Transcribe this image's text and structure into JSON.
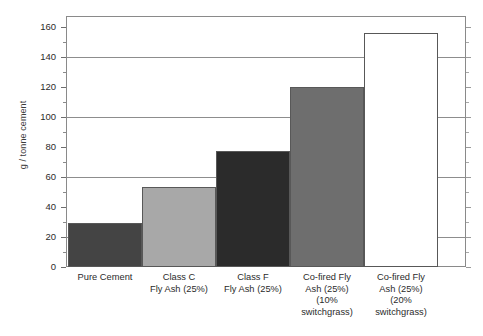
{
  "chart_data": {
    "type": "bar",
    "title": "",
    "subtitle": "",
    "xlabel": "",
    "ylabel": "g / tonne cement",
    "ylim": [
      0,
      167
    ],
    "grid": true,
    "legend": "none",
    "gridline_values": [
      20,
      60,
      100,
      140
    ],
    "y_major_ticks": [
      0,
      20,
      40,
      60,
      80,
      100,
      120,
      140,
      160
    ],
    "y_minor_tick_step": 10,
    "y_tick_labels": [
      "0",
      "20",
      "40",
      "60",
      "80",
      "100",
      "120",
      "140",
      "160"
    ],
    "categories": [
      "Pure Cement",
      "Class C Fly Ash (25%)",
      "Class F Fly Ash (25%)",
      "Co-fired Fly Ash (25%) (10% switchgrass)",
      "Co-fired Fly Ash (25%) (20% switchgrass)"
    ],
    "category_label_lines": [
      [
        "Pure Cement"
      ],
      [
        "Class C",
        "Fly Ash (25%)"
      ],
      [
        "Class F",
        "Fly Ash (25%)"
      ],
      [
        "Co-fired Fly",
        "Ash (25%)",
        "(10%",
        "switchgrass)"
      ],
      [
        "Co-fired Fly",
        "Ash (25%)",
        "(20%",
        "switchgrass)"
      ]
    ],
    "values": [
      29,
      53,
      77,
      120,
      156
    ],
    "bar_colors": [
      "#444444",
      "#a8a8a8",
      "#2b2b2b",
      "#6e6e6e",
      "#ffffff"
    ],
    "bar_edge_color": "#585858",
    "gridline_color": "#8d8d8d",
    "axis_color": "#8a8a8a"
  }
}
